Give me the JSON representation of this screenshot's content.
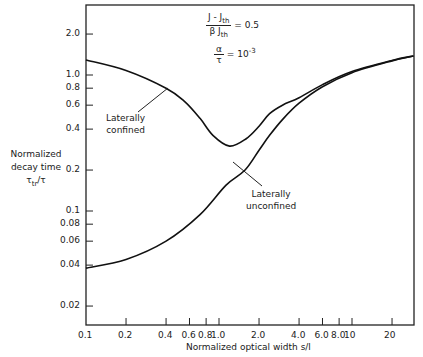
{
  "chart_data": {
    "type": "line",
    "title": "",
    "xlabel": "Normalized optical width s/l",
    "ylabel": "Normalized decay time τtr/τ",
    "xscale": "log",
    "yscale": "log",
    "xlim": [
      0.1,
      29
    ],
    "ylim": [
      0.0145,
      3.27
    ],
    "grid": false,
    "x_ticks": [
      "0.1",
      "0.2",
      "0.4",
      "0.6",
      "0.8",
      "1.0",
      "2.0",
      "4.0",
      "6.0",
      "8.0",
      "10",
      "20"
    ],
    "y_ticks": [
      "0.02",
      "0.04",
      "0.06",
      "0.08",
      "0.1",
      "0.2",
      "0.4",
      "0.6",
      "0.8",
      "1.0",
      "2.0"
    ],
    "annotations": [
      {
        "text": "(J - Jth) / (β Jth) = 0.5"
      },
      {
        "text": "α/τ = 10^-3"
      },
      {
        "text": "Laterally confined"
      },
      {
        "text": "Laterally unconfined"
      }
    ],
    "series": [
      {
        "name": "Laterally confined",
        "x": [
          0.1,
          0.2,
          0.4,
          0.55,
          0.72,
          0.9,
          1.2,
          1.6,
          2.0,
          2.4,
          3.0,
          4.0,
          6.0,
          10,
          20,
          29
        ],
        "y": [
          1.29,
          1.08,
          0.8,
          0.64,
          0.48,
          0.36,
          0.3,
          0.34,
          0.42,
          0.52,
          0.6,
          0.68,
          0.85,
          1.06,
          1.28,
          1.38
        ]
      },
      {
        "name": "Laterally unconfined",
        "x": [
          0.1,
          0.2,
          0.4,
          0.72,
          1.13,
          1.57,
          2.0,
          2.4,
          3.0,
          4.0,
          6.0,
          10,
          20,
          29
        ],
        "y": [
          0.038,
          0.044,
          0.06,
          0.094,
          0.155,
          0.2,
          0.28,
          0.36,
          0.47,
          0.62,
          0.82,
          1.04,
          1.27,
          1.38
        ]
      }
    ]
  },
  "labels": {
    "ylabel_line1": "Normalized",
    "ylabel_line2": "decay time",
    "ylabel_sym": "τ",
    "ylabel_sub": "tr",
    "ylabel_tail": "/τ",
    "xlabel": "Normalized optical width  s/l",
    "param1_num": "J - J",
    "param1_num_sub": "th",
    "param1_den": "β J",
    "param1_den_sub": "th",
    "param1_val": "= 0.5",
    "param2_num": "α",
    "param2_den": "τ",
    "param2_val": "= 10",
    "param2_exp": "-3",
    "confined_1": "Laterally",
    "confined_2": "confined",
    "unconfined_1": "Laterally",
    "unconfined_2": "unconfined"
  }
}
